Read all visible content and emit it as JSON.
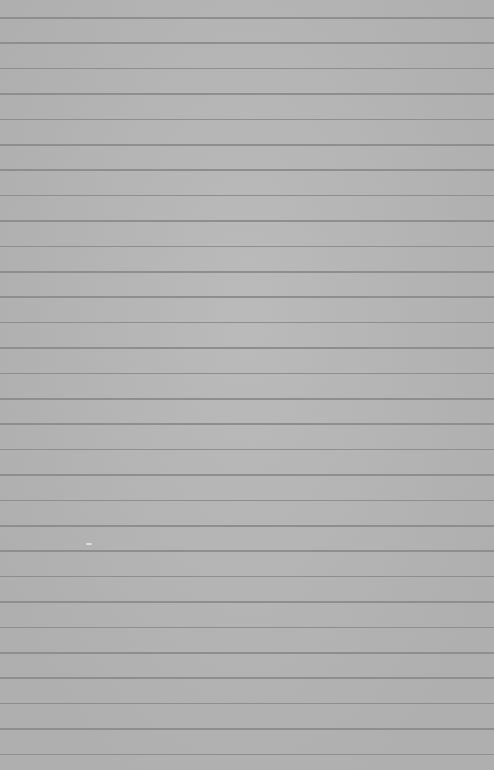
{
  "paper": {
    "background_color": "#b6b6b6",
    "rule_color": "#8e8e8e",
    "first_rule_y": 17,
    "rule_spacing": 25.4,
    "rule_count": 30
  }
}
